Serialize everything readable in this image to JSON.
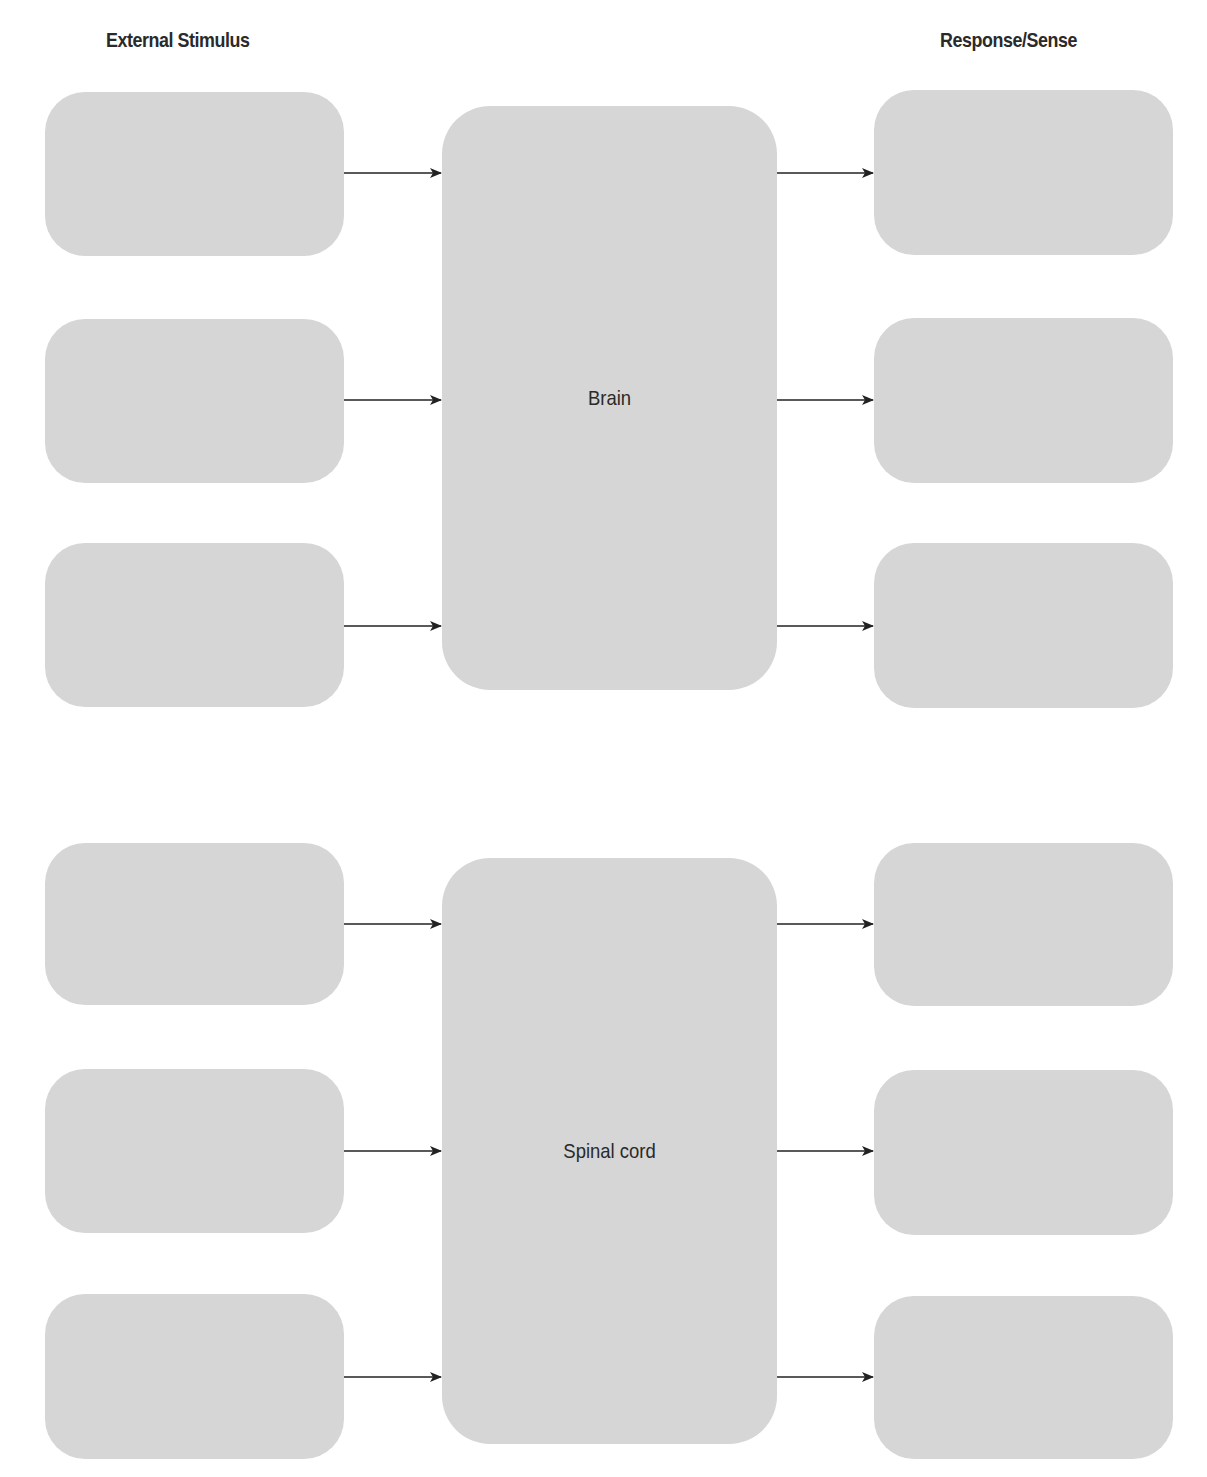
{
  "headers": {
    "left": "External Stimulus",
    "right": "Response/Sense"
  },
  "diagrams": [
    {
      "center_label": "Brain",
      "inputs": [
        "",
        "",
        ""
      ],
      "outputs": [
        "",
        "",
        ""
      ]
    },
    {
      "center_label": "Spinal cord",
      "inputs": [
        "",
        "",
        ""
      ],
      "outputs": [
        "",
        "",
        ""
      ]
    }
  ],
  "colors": {
    "box_fill": "#d6d6d6",
    "arrow": "#222222",
    "text": "#2a2a2a"
  }
}
